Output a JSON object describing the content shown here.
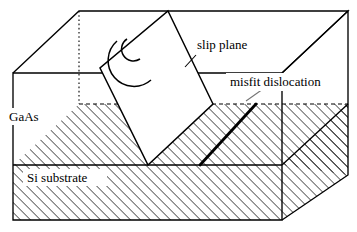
{
  "figure": {
    "type": "schematic-diagram",
    "background_color": "#ffffff",
    "line_color": "#000000"
  },
  "labels": {
    "slip_plane": "slip plane",
    "misfit_dislocation": "misfit dislocation",
    "gaas_layer": "GaAs",
    "si_substrate": "Si substrate"
  },
  "regions": [
    {
      "name": "gaas-layer",
      "label": "GaAs",
      "fill": "hatched-45",
      "hatch_spacing_px": 5
    },
    {
      "name": "si-substrate",
      "label": "Si substrate",
      "fill": "hatched-45",
      "hatch_spacing_px": 5
    }
  ],
  "geometry": {
    "block": {
      "front_top_left": [
        13,
        73
      ],
      "front_top_right": [
        282,
        73
      ],
      "front_bottom_left": [
        13,
        220
      ],
      "front_bottom_right": [
        282,
        220
      ],
      "back_top_left": [
        79,
        11
      ],
      "back_top_right": [
        348,
        11
      ],
      "back_bottom_right": [
        348,
        175
      ],
      "hidden_back_bottom_left": [
        79,
        104
      ]
    },
    "interface": {
      "front_line_y": 165,
      "back_dashed_line_y": 104,
      "right_edge_from": [
        282,
        165
      ],
      "right_edge_to": [
        348,
        104
      ]
    },
    "slip_plane_polygon": [
      [
        168,
        11
      ],
      [
        100,
        68
      ],
      [
        148,
        165
      ],
      [
        213,
        104
      ]
    ],
    "spiral": {
      "outer_arc_center": [
        140,
        55
      ],
      "outer_arc_radius": 25,
      "inner_arc_center": [
        135,
        48
      ],
      "inner_arc_radius": 11
    },
    "misfit_dislocation_line": {
      "from": [
        200,
        165
      ],
      "to": [
        256,
        104
      ],
      "stroke_width": 2.6
    },
    "leaders": [
      {
        "name": "slip-plane-leader",
        "from": [
          196,
          55
        ],
        "to": [
          186,
          66
        ]
      },
      {
        "name": "misfit-dislocation-leader",
        "from": [
          262,
          90
        ],
        "to": [
          247,
          101
        ]
      }
    ]
  }
}
